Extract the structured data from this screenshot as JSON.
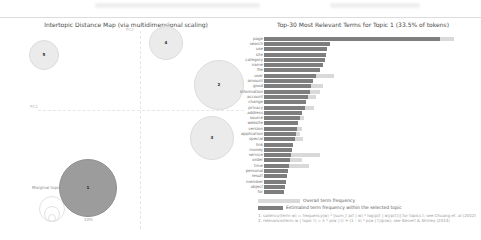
{
  "colors": {
    "topic_bar": "#7e7e7e",
    "overall_bar": "#d9d9d9",
    "circle": "#ebebeb",
    "circle_border": "#dcdcdc",
    "selected_circle": "#9c9c9c",
    "selected_circle_border": "#8f8f8f"
  },
  "left_panel": {
    "title": "Intertopic Distance Map (via multidimensional scaling)",
    "axis": {
      "x_label": "PC1",
      "y_label": "PC2"
    },
    "marginal_legend": {
      "label": "Marginal topic distribution",
      "sizes": [
        "2%",
        "5%",
        "10%"
      ]
    },
    "topics": [
      {
        "label": "1",
        "cx": 80,
        "cy": 171,
        "r": 29,
        "selected": true
      },
      {
        "label": "2",
        "cx": 211,
        "cy": 68,
        "r": 25,
        "selected": false
      },
      {
        "label": "3",
        "cx": 204,
        "cy": 121,
        "r": 22,
        "selected": false
      },
      {
        "label": "4",
        "cx": 158,
        "cy": 26,
        "r": 17,
        "selected": false
      },
      {
        "label": "5",
        "cx": 36,
        "cy": 38,
        "r": 15,
        "selected": false
      }
    ]
  },
  "right_panel": {
    "title": "Top-30 Most Relevant Terms for Topic 1 (33.5% of tokens)",
    "legend": {
      "overall": "Overall term frequency",
      "topic": "Estimated term frequency within the selected topic"
    },
    "footnotes": [
      "1. saliency(term w) = frequency(w) * [sum_t p(t | w) * log(p(t | w)/p(t))] for topics t; see Chuang et. al (2012)",
      "2. relevance(term w | topic t) = λ * p(w | t) + (1 - λ) * p(w | t)/p(w); see Sievert & Shirley (2014)"
    ],
    "terms": [
      {
        "term": "page",
        "topic": 176,
        "overall": 190
      },
      {
        "term": "search",
        "topic": 66,
        "overall": 66
      },
      {
        "term": "use",
        "topic": 63,
        "overall": 63
      },
      {
        "term": "site",
        "topic": 62,
        "overall": 62
      },
      {
        "term": "category",
        "topic": 61,
        "overall": 61
      },
      {
        "term": "name",
        "topic": 59,
        "overall": 59
      },
      {
        "term": "file",
        "topic": 56,
        "overall": 56
      },
      {
        "term": "user",
        "topic": 52,
        "overall": 70
      },
      {
        "term": "amount",
        "topic": 49,
        "overall": 49
      },
      {
        "term": "good",
        "topic": 47,
        "overall": 59
      },
      {
        "term": "information",
        "topic": 46,
        "overall": 56
      },
      {
        "term": "account",
        "topic": 44,
        "overall": 52
      },
      {
        "term": "change",
        "topic": 42,
        "overall": 42
      },
      {
        "term": "privacy",
        "topic": 41,
        "overall": 50
      },
      {
        "term": "address",
        "topic": 38,
        "overall": 38
      },
      {
        "term": "source",
        "topic": 36,
        "overall": 40
      },
      {
        "term": "website",
        "topic": 34,
        "overall": 34
      },
      {
        "term": "version",
        "topic": 33,
        "overall": 38
      },
      {
        "term": "application",
        "topic": 32,
        "overall": 36
      },
      {
        "term": "special",
        "topic": 31,
        "overall": 39
      },
      {
        "term": "link",
        "topic": 29,
        "overall": 29
      },
      {
        "term": "money",
        "topic": 28,
        "overall": 28
      },
      {
        "term": "service",
        "topic": 27,
        "overall": 56
      },
      {
        "term": "order",
        "topic": 26,
        "overall": 38
      },
      {
        "term": "time",
        "topic": 25,
        "overall": 45
      },
      {
        "term": "personal",
        "topic": 24,
        "overall": 24
      },
      {
        "term": "result",
        "topic": 23,
        "overall": 23
      },
      {
        "term": "member",
        "topic": 22,
        "overall": 22
      },
      {
        "term": "object",
        "topic": 21,
        "overall": 21
      },
      {
        "term": "for",
        "topic": 20,
        "overall": 20
      }
    ]
  },
  "chart_data": [
    {
      "type": "scatter",
      "title": "Intertopic Distance Map (via multidimensional scaling)",
      "xlabel": "PC1",
      "ylabel": "PC2",
      "legend_position": "bottom-left",
      "size_legend": {
        "label": "Marginal topic distribution",
        "ticks": [
          "2%",
          "5%",
          "10%"
        ]
      },
      "points": [
        {
          "topic": 1,
          "x": -0.39,
          "y": -0.7,
          "marginal_size": "largest",
          "selected": true
        },
        {
          "topic": 2,
          "x": 0.6,
          "y": 0.23,
          "marginal_size": "large",
          "selected": false
        },
        {
          "topic": 3,
          "x": 0.54,
          "y": -0.25,
          "marginal_size": "medium",
          "selected": false
        },
        {
          "topic": 4,
          "x": 0.2,
          "y": 0.61,
          "marginal_size": "small",
          "selected": false
        },
        {
          "topic": 5,
          "x": -0.72,
          "y": 0.5,
          "marginal_size": "small",
          "selected": false
        }
      ]
    },
    {
      "type": "bar",
      "orientation": "horizontal",
      "title": "Top-30 Most Relevant Terms for Topic 1 (33.5% of tokens)",
      "xlabel": "term frequency (relative units, pixel-measured; no axis ticks visible)",
      "ylabel": "",
      "grid": false,
      "legend_position": "bottom",
      "categories": [
        "page",
        "search",
        "use",
        "site",
        "category",
        "name",
        "file",
        "user",
        "amount",
        "good",
        "information",
        "account",
        "change",
        "privacy",
        "address",
        "source",
        "website",
        "version",
        "application",
        "special",
        "link",
        "money",
        "service",
        "order",
        "time",
        "personal",
        "result",
        "member",
        "object",
        "for"
      ],
      "series": [
        {
          "name": "Estimated term frequency within the selected topic",
          "values": [
            176,
            66,
            63,
            62,
            61,
            59,
            56,
            52,
            49,
            47,
            46,
            44,
            42,
            41,
            38,
            36,
            34,
            33,
            32,
            31,
            29,
            28,
            27,
            26,
            25,
            24,
            23,
            22,
            21,
            20
          ]
        },
        {
          "name": "Overall term frequency",
          "values": [
            190,
            66,
            63,
            62,
            61,
            59,
            56,
            70,
            49,
            59,
            56,
            52,
            42,
            50,
            38,
            40,
            34,
            38,
            36,
            39,
            29,
            28,
            56,
            38,
            45,
            24,
            23,
            22,
            21,
            20
          ]
        }
      ]
    }
  ]
}
